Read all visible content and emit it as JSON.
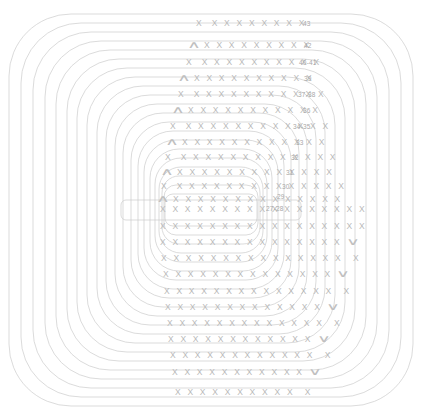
{
  "figure": {
    "background_color": "#ffffff",
    "line_color": "#cccccc",
    "glyph_color": "#b9b9b9",
    "label_color": "#a8a8a8",
    "glyph_symbol": "X",
    "caret_up_symbol": "∧",
    "caret_down_symbol": "∨"
  },
  "chart_data": {
    "type": "table",
    "xlabel": "",
    "ylabel": "",
    "legend": [],
    "ring_count": 24,
    "ring_labels": [
      "43",
      "42",
      "40-41",
      "39",
      "37-38",
      "36",
      "34-35",
      "33",
      "32",
      "31",
      "30",
      "29",
      "27-28"
    ],
    "categories": [
      "row-1",
      "row-2",
      "row-3",
      "row-4",
      "row-5",
      "row-6",
      "row-7",
      "row-8",
      "row-9",
      "row-10",
      "row-11",
      "row-12",
      "row-13",
      "row-14",
      "row-15",
      "row-16",
      "row-17",
      "row-18",
      "row-19",
      "row-20",
      "row-21",
      "row-22",
      "row-23",
      "row-24"
    ],
    "values": [
      9,
      10,
      11,
      11,
      12,
      12,
      13,
      13,
      14,
      14,
      15,
      15,
      17,
      17,
      16,
      15,
      14,
      14,
      13,
      13,
      12,
      12,
      11,
      10
    ]
  },
  "rows": [
    {
      "id": "row-1",
      "lead": "X",
      "lead_kind": "glyph",
      "gap": true,
      "count": 8,
      "trail": "",
      "trail_kind": "none",
      "label": "43",
      "top": 18,
      "left": 196,
      "label_left": 303,
      "label_top": 20
    },
    {
      "id": "row-2",
      "lead": "∧",
      "lead_kind": "caret",
      "gap": false,
      "count": 9,
      "trail": "",
      "trail_kind": "none",
      "label": "42",
      "top": 40,
      "left": 190,
      "label_left": 304,
      "label_top": 42
    },
    {
      "id": "row-3",
      "lead": "X",
      "lead_kind": "glyph",
      "gap": true,
      "count": 10,
      "trail": "",
      "trail_kind": "none",
      "label": "40-41",
      "top": 57,
      "left": 186,
      "label_left": 299,
      "label_top": 59
    },
    {
      "id": "row-4",
      "lead": "∧",
      "lead_kind": "caret",
      "gap": false,
      "count": 10,
      "trail": "",
      "trail_kind": "none",
      "label": "39",
      "top": 73,
      "left": 180,
      "label_left": 304,
      "label_top": 75
    },
    {
      "id": "row-5",
      "lead": "X",
      "lead_kind": "glyph",
      "gap": true,
      "count": 11,
      "trail": "",
      "trail_kind": "none",
      "label": "37-38",
      "top": 89,
      "left": 178,
      "label_left": 298,
      "label_top": 91
    },
    {
      "id": "row-6",
      "lead": "∧",
      "lead_kind": "caret",
      "gap": false,
      "count": 11,
      "trail": "",
      "trail_kind": "none",
      "label": "36",
      "top": 105,
      "left": 174,
      "label_left": 303,
      "label_top": 107
    },
    {
      "id": "row-7",
      "lead": "X",
      "lead_kind": "glyph",
      "gap": true,
      "count": 12,
      "trail": "",
      "trail_kind": "none",
      "label": "34-35",
      "top": 121,
      "left": 170,
      "label_left": 293,
      "label_top": 123
    },
    {
      "id": "row-8",
      "lead": "∧",
      "lead_kind": "caret",
      "gap": false,
      "count": 12,
      "trail": "",
      "trail_kind": "none",
      "label": "33",
      "top": 137,
      "left": 168,
      "label_left": 296,
      "label_top": 139
    },
    {
      "id": "row-9",
      "lead": "X",
      "lead_kind": "glyph",
      "gap": true,
      "count": 13,
      "trail": "",
      "trail_kind": "none",
      "label": "32",
      "top": 152,
      "left": 165,
      "label_left": 291,
      "label_top": 154
    },
    {
      "id": "row-10",
      "lead": "∧",
      "lead_kind": "caret",
      "gap": false,
      "count": 13,
      "trail": "",
      "trail_kind": "none",
      "label": "31",
      "top": 167,
      "left": 163,
      "label_left": 286,
      "label_top": 169
    },
    {
      "id": "row-11",
      "lead": "X",
      "lead_kind": "glyph",
      "gap": true,
      "count": 14,
      "trail": "",
      "trail_kind": "none",
      "label": "30",
      "top": 181,
      "left": 161,
      "label_left": 282,
      "label_top": 183
    },
    {
      "id": "row-12",
      "lead": "∧",
      "lead_kind": "caret",
      "gap": false,
      "count": 14,
      "trail": "",
      "trail_kind": "none",
      "label": "29",
      "top": 194,
      "left": 159,
      "label_left": 277,
      "label_top": 193
    },
    {
      "id": "row-13",
      "lead": "",
      "lead_kind": "none",
      "gap": false,
      "count": 17,
      "trail": "",
      "trail_kind": "none",
      "label": "27-28",
      "top": 204,
      "left": 160,
      "label_left": 266,
      "label_top": 205
    },
    {
      "id": "row-14",
      "lead": "",
      "lead_kind": "none",
      "gap": false,
      "count": 17,
      "trail": "",
      "trail_kind": "none",
      "label": "",
      "top": 221,
      "left": 160,
      "label_left": 0,
      "label_top": 0
    },
    {
      "id": "row-15",
      "lead": "",
      "lead_kind": "none",
      "gap": false,
      "count": 15,
      "trail": "∨",
      "trail_kind": "caret",
      "label": "",
      "top": 237,
      "left": 160,
      "label_left": 0,
      "label_top": 0
    },
    {
      "id": "row-16",
      "lead": "",
      "lead_kind": "none",
      "gap": false,
      "count": 15,
      "trail": "X",
      "trail_kind": "glyph",
      "label": "",
      "top": 253,
      "left": 161,
      "label_left": 0,
      "label_top": 0
    },
    {
      "id": "row-17",
      "lead": "",
      "lead_kind": "none",
      "gap": false,
      "count": 14,
      "trail": "∨",
      "trail_kind": "caret",
      "label": "",
      "top": 269,
      "left": 163,
      "label_left": 0,
      "label_top": 0
    },
    {
      "id": "row-18",
      "lead": "",
      "lead_kind": "none",
      "gap": false,
      "count": 14,
      "trail": "X",
      "trail_kind": "glyph",
      "label": "",
      "top": 286,
      "left": 164,
      "label_left": 0,
      "label_top": 0
    },
    {
      "id": "row-19",
      "lead": "",
      "lead_kind": "none",
      "gap": false,
      "count": 13,
      "trail": "∨",
      "trail_kind": "caret",
      "label": "",
      "top": 302,
      "left": 165,
      "label_left": 0,
      "label_top": 0
    },
    {
      "id": "row-20",
      "lead": "",
      "lead_kind": "none",
      "gap": false,
      "count": 13,
      "trail": "X",
      "trail_kind": "glyph",
      "label": "",
      "top": 318,
      "left": 167,
      "label_left": 0,
      "label_top": 0
    },
    {
      "id": "row-21",
      "lead": "",
      "lead_kind": "none",
      "gap": false,
      "count": 12,
      "trail": "∨",
      "trail_kind": "caret",
      "label": "",
      "top": 334,
      "left": 168,
      "label_left": 0,
      "label_top": 0
    },
    {
      "id": "row-22",
      "lead": "",
      "lead_kind": "none",
      "gap": false,
      "count": 12,
      "trail": "X",
      "trail_kind": "glyph",
      "label": "",
      "top": 350,
      "left": 170,
      "label_left": 0,
      "label_top": 0
    },
    {
      "id": "row-23",
      "lead": "",
      "lead_kind": "none",
      "gap": false,
      "count": 11,
      "trail": "∨",
      "trail_kind": "caret",
      "label": "",
      "top": 367,
      "left": 172,
      "label_left": 0,
      "label_top": 0
    },
    {
      "id": "row-24",
      "lead": "",
      "lead_kind": "none",
      "gap": false,
      "count": 10,
      "trail": "X",
      "trail_kind": "glyph",
      "label": "",
      "top": 387,
      "left": 175,
      "label_left": 0,
      "label_top": 0
    }
  ],
  "rings": [
    {
      "id": "ring-1",
      "cx": 211,
      "cy": 210,
      "rx": 202,
      "ry": 196,
      "radius": 62
    },
    {
      "id": "ring-2",
      "cx": 211,
      "cy": 210,
      "rx": 190,
      "ry": 187,
      "radius": 60
    },
    {
      "id": "ring-3",
      "cx": 211,
      "cy": 210,
      "rx": 178,
      "ry": 178,
      "radius": 58
    },
    {
      "id": "ring-4",
      "cx": 211,
      "cy": 210,
      "rx": 166,
      "ry": 169,
      "radius": 56
    },
    {
      "id": "ring-5",
      "cx": 211,
      "cy": 210,
      "rx": 155,
      "ry": 160,
      "radius": 54
    },
    {
      "id": "ring-6",
      "cx": 211,
      "cy": 210,
      "rx": 144,
      "ry": 151,
      "radius": 52
    },
    {
      "id": "ring-7",
      "cx": 211,
      "cy": 210,
      "rx": 134,
      "ry": 142,
      "radius": 50
    },
    {
      "id": "ring-8",
      "cx": 211,
      "cy": 210,
      "rx": 124,
      "ry": 133,
      "radius": 48
    },
    {
      "id": "ring-9",
      "cx": 211,
      "cy": 210,
      "rx": 114,
      "ry": 124,
      "radius": 46
    },
    {
      "id": "ring-10",
      "cx": 211,
      "cy": 210,
      "rx": 105,
      "ry": 115,
      "radius": 44
    },
    {
      "id": "ring-11",
      "cx": 211,
      "cy": 210,
      "rx": 96,
      "ry": 106,
      "radius": 42
    },
    {
      "id": "ring-12",
      "cx": 211,
      "cy": 210,
      "rx": 88,
      "ry": 97,
      "radius": 40
    },
    {
      "id": "ring-13",
      "cx": 211,
      "cy": 210,
      "rx": 80,
      "ry": 88,
      "radius": 38
    },
    {
      "id": "ring-14",
      "cx": 211,
      "cy": 210,
      "rx": 73,
      "ry": 79,
      "radius": 35
    },
    {
      "id": "ring-15",
      "cx": 211,
      "cy": 210,
      "rx": 67,
      "ry": 70,
      "radius": 32
    },
    {
      "id": "ring-16",
      "cx": 211,
      "cy": 210,
      "rx": 61,
      "ry": 61,
      "radius": 29
    },
    {
      "id": "ring-17",
      "cx": 211,
      "cy": 210,
      "rx": 56,
      "ry": 52,
      "radius": 26
    },
    {
      "id": "ring-18",
      "cx": 211,
      "cy": 210,
      "rx": 52,
      "ry": 43,
      "radius": 22
    },
    {
      "id": "ring-19",
      "cx": 211,
      "cy": 210,
      "rx": 49,
      "ry": 34,
      "radius": 17
    },
    {
      "id": "ring-20",
      "cx": 211,
      "cy": 210,
      "rx": 47,
      "ry": 25,
      "radius": 12
    },
    {
      "id": "ring-21",
      "cx": 211,
      "cy": 210,
      "rx": 46,
      "ry": 16,
      "radius": 8
    },
    {
      "id": "ring-22",
      "cx": 211,
      "cy": 210,
      "rx": 90,
      "ry": 10,
      "radius": 5
    }
  ]
}
